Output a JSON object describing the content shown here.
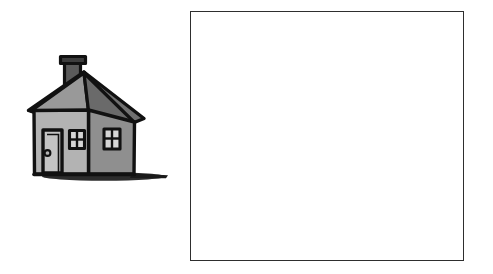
{
  "page": {
    "background_color": "#ffffff",
    "width": 493,
    "height": 274
  },
  "illustration": {
    "name": "house-clipart",
    "description": "Hand-drawn grayscale clip-art of a small house with a chimney, pitched roof, front door and two four-pane windows, with a cast ground shadow",
    "style": "grayscale ink-outline cartoon",
    "colors": {
      "outline": "#111111",
      "roof_left": "#999999",
      "roof_right": "#707070",
      "wall_front": "#b3b3b3",
      "wall_side": "#8f8f8f",
      "chimney": "#5a5a5a",
      "chimney_cap": "#3d3d3d",
      "door_panel": "#c4c4c4",
      "window_pane": "#d6d6d6",
      "shadow": "#1a1a1a"
    },
    "parts": [
      {
        "name": "chimney",
        "label": "Chimney"
      },
      {
        "name": "chimney-cap",
        "label": "Chimney cap"
      },
      {
        "name": "roof-left-slope",
        "label": "Roof left slope"
      },
      {
        "name": "roof-right-slope",
        "label": "Roof right slope"
      },
      {
        "name": "front-wall",
        "label": "Front wall"
      },
      {
        "name": "side-wall",
        "label": "Side wall"
      },
      {
        "name": "front-door",
        "label": "Front door"
      },
      {
        "name": "door-knob",
        "label": "Door knob"
      },
      {
        "name": "front-window",
        "label": "Front window (4 panes)"
      },
      {
        "name": "side-window",
        "label": "Side window (4 panes)"
      },
      {
        "name": "ground-shadow",
        "label": "Ground shadow"
      }
    ]
  },
  "box": {
    "name": "empty-box",
    "label": "",
    "content": "",
    "border_color": "#2e2e2e",
    "fill_color": "#ffffff",
    "border_width_px": 1.5,
    "x": 190,
    "y": 11,
    "width": 274,
    "height": 250
  }
}
